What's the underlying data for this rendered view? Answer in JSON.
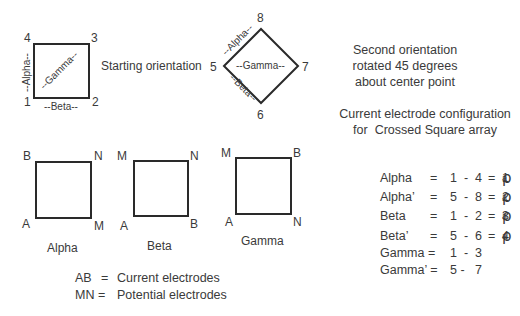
{
  "top": {
    "starting_square": {
      "corners": {
        "top_left": "4",
        "top_right": "3",
        "bottom_left": "1",
        "bottom_right": "2"
      },
      "side_labels": {
        "left": "--Alpha--",
        "bottom": "--Beta--",
        "diagonal": "--Gamma--"
      },
      "caption": "Starting orientation"
    },
    "rotated_square": {
      "corners": {
        "top": "8",
        "right": "7",
        "bottom": "6",
        "left": "5"
      },
      "side_labels": {
        "upper_left": "--Alpha--",
        "lower_left": "--Beta--",
        "horizontal": "--Gamma--"
      },
      "caption_lines": [
        "Second orientation",
        "rotated 45 degrees",
        "about center point"
      ]
    }
  },
  "subtitle_lines": [
    "Current electrode configuration",
    "for  Crossed Square array"
  ],
  "configs": [
    {
      "name": "Alpha",
      "corners": {
        "top_left": "B",
        "top_right": "N",
        "bottom_left": "A",
        "bottom_right": "M"
      }
    },
    {
      "name": "Beta",
      "corners": {
        "top_left": "M",
        "top_right": "N",
        "bottom_left": "A",
        "bottom_right": "B"
      }
    },
    {
      "name": "Gamma",
      "corners": {
        "top_left": "M",
        "top_right": "B",
        "bottom_left": "A",
        "bottom_right": "N"
      }
    }
  ],
  "legend": [
    {
      "key": "AB",
      "sep": "=",
      "value": "Current electrodes"
    },
    {
      "key": "MN =",
      "sep": "",
      "value": "Potential electrodes"
    }
  ],
  "equations": [
    {
      "name": "Alpha",
      "eq": "=",
      "pair": "1  -  4",
      "eq2": "=",
      "rho": "ρ",
      "sub": "a",
      "idx": "1"
    },
    {
      "name": "Alpha’",
      "eq": "=",
      "pair": "5  -  8",
      "eq2": "=",
      "rho": "ρ",
      "sub": "a",
      "idx": "2"
    },
    {
      "name": "Beta",
      "eq": "=",
      "pair": "1  -  2",
      "eq2": "=",
      "rho": "ρ",
      "sub": "a",
      "idx": "3"
    },
    {
      "name": "Beta’",
      "eq": "=",
      "pair": "5  -  6",
      "eq2": "=",
      "rho": "ρ",
      "sub": "a",
      "idx": "4"
    },
    {
      "name": "Gamma =",
      "eq": "",
      "pair": "1  -  3",
      "eq2": "",
      "rho": "",
      "sub": "",
      "idx": ""
    },
    {
      "name": "Gamma’ =",
      "eq": "",
      "pair": "5 -   7",
      "eq2": "",
      "rho": "",
      "sub": "",
      "idx": ""
    }
  ]
}
